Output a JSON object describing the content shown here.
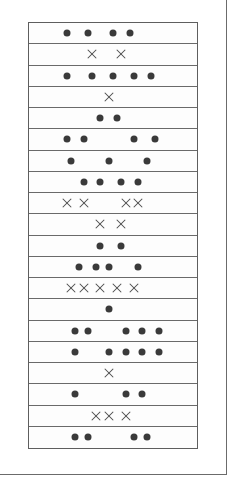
{
  "figure": {
    "grid_columns": 40,
    "symbol_legend": {
      "dot": "filled-circle",
      "cross": "x-mark"
    },
    "rows": [
      {
        "type": "dot",
        "slots": [
          9,
          14,
          20,
          24
        ]
      },
      {
        "type": "cross",
        "slots": [
          15,
          22
        ]
      },
      {
        "type": "dot",
        "slots": [
          9,
          15,
          20,
          25,
          29
        ]
      },
      {
        "type": "cross",
        "slots": [
          19
        ]
      },
      {
        "type": "dot",
        "slots": [
          17,
          21
        ]
      },
      {
        "type": "dot",
        "slots": [
          9,
          13,
          25,
          30
        ]
      },
      {
        "type": "dot",
        "slots": [
          10,
          19,
          28
        ]
      },
      {
        "type": "dot",
        "slots": [
          13,
          17,
          22,
          26
        ]
      },
      {
        "type": "cross",
        "slots": [
          9,
          13,
          23,
          26
        ]
      },
      {
        "type": "cross",
        "slots": [
          17,
          22
        ]
      },
      {
        "type": "dot",
        "slots": [
          17,
          22
        ]
      },
      {
        "type": "dot",
        "slots": [
          12,
          16,
          19,
          26
        ]
      },
      {
        "type": "cross",
        "slots": [
          10,
          13,
          17,
          21,
          25
        ]
      },
      {
        "type": "dot",
        "slots": [
          19
        ]
      },
      {
        "type": "dot",
        "slots": [
          11,
          14,
          23,
          27,
          31
        ]
      },
      {
        "type": "dot",
        "slots": [
          11,
          19,
          23,
          27,
          31
        ]
      },
      {
        "type": "cross",
        "slots": [
          19
        ]
      },
      {
        "type": "dot",
        "slots": [
          11,
          23,
          27
        ]
      },
      {
        "type": "cross",
        "slots": [
          16,
          19,
          23
        ]
      },
      {
        "type": "dot",
        "slots": [
          11,
          14,
          25,
          28
        ]
      }
    ]
  }
}
